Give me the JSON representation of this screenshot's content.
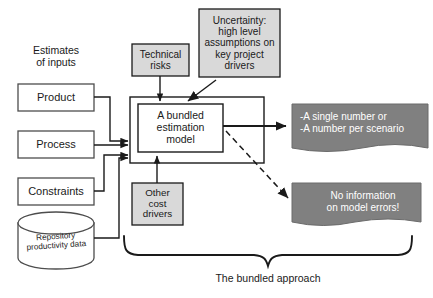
{
  "diagram": {
    "title": "The bundled approach",
    "caption": "The bundled approach",
    "colors": {
      "stroke": "#1a1a1a",
      "box_fill_white": "#ffffff",
      "box_fill_gray": "#d9d9d9",
      "banner_fill": "#808080",
      "banner_text": "#ffffff",
      "text": "#1a1a1a",
      "page_background": "#ffffff"
    },
    "group_label": {
      "name": "estimates-of-inputs",
      "text": "Estimates\nof inputs"
    },
    "input_boxes": [
      {
        "name": "product-box",
        "label": "Product",
        "fill": "#ffffff"
      },
      {
        "name": "process-box",
        "label": "Process",
        "fill": "#ffffff"
      },
      {
        "name": "constraints-box",
        "label": "Constraints",
        "fill": "#ffffff"
      }
    ],
    "repository": {
      "name": "repository-cylinder",
      "label": "Repository\nproductivity data",
      "fill": "#ffffff"
    },
    "factor_boxes": [
      {
        "name": "technical-risks-box",
        "label": "Technical\nrisks",
        "fill": "#d9d9d9"
      },
      {
        "name": "uncertainty-box",
        "label": "Uncertainty:\nhigh level\nassumptions on\nkey project\ndrivers",
        "fill": "#d9d9d9"
      },
      {
        "name": "other-cost-drivers-box",
        "label": "Other\ncost\ndrivers",
        "fill": "#d9d9d9"
      }
    ],
    "model_box": {
      "name": "bundled-estimation-model-box",
      "label": "A bundled\nestimation\nmodel",
      "fill": "#ffffff"
    },
    "outputs": [
      {
        "name": "single-number-banner",
        "label": "-A single number or\n-A number per scenario",
        "fill": "#808080",
        "arrow": "solid"
      },
      {
        "name": "no-information-banner",
        "label": "No information\non model errors!",
        "fill": "#808080",
        "arrow": "dashed"
      }
    ],
    "brace": {
      "name": "bundled-approach-brace",
      "caption": "The bundled approach"
    }
  }
}
